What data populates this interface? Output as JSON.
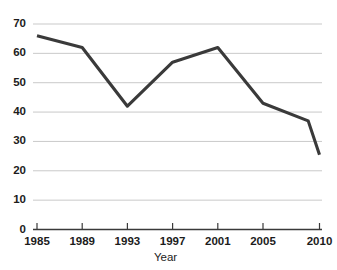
{
  "chart_data": {
    "type": "line",
    "title": "",
    "xlabel": "Year",
    "ylabel": "",
    "x": [
      1985,
      1989,
      1993,
      1997,
      2001,
      2005,
      2009,
      2010
    ],
    "values": [
      66,
      62,
      42,
      57,
      62,
      43,
      37,
      25.5
    ],
    "series": [
      {
        "name": "series-1",
        "values": [
          66,
          62,
          42,
          57,
          62,
          43,
          37,
          25.5
        ],
        "color": "#3a3a3a"
      }
    ],
    "xtick_labels": [
      "1985",
      "1989",
      "1993",
      "1997",
      "2001",
      "2005",
      "2010"
    ],
    "xtick_values": [
      1985,
      1989,
      1993,
      1997,
      2001,
      2005,
      2010
    ],
    "ytick_labels": [
      "0",
      "10",
      "20",
      "30",
      "40",
      "50",
      "60",
      "70"
    ],
    "ytick_values": [
      0,
      10,
      20,
      30,
      40,
      50,
      60,
      70
    ],
    "ylim": [
      0,
      70
    ],
    "grid": "horizontal",
    "legend": "none",
    "gridline_color": "#c9c9c9",
    "axis_color": "#3a3a3a",
    "line_color": "#3a3a3a",
    "background_color": "#ffffff"
  },
  "axis": {
    "x_title": "Year"
  }
}
